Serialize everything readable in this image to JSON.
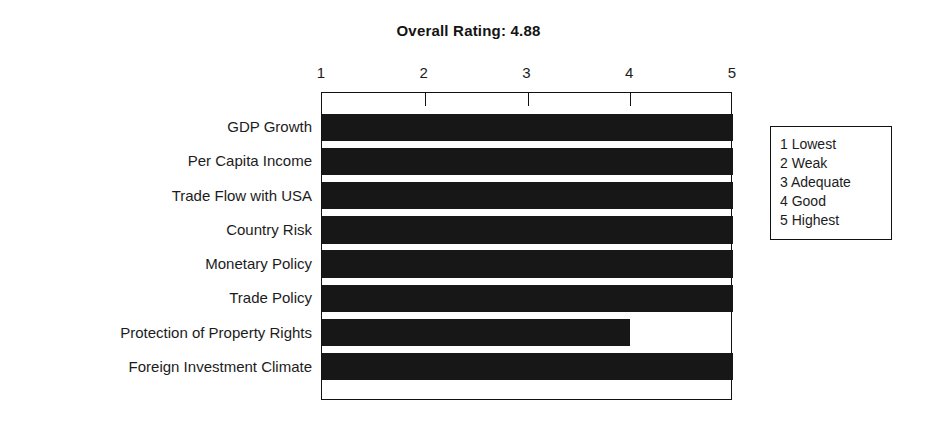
{
  "chart_data": {
    "type": "bar",
    "orientation": "horizontal",
    "title": "Overall Rating: 4.88",
    "xlabel": "",
    "ylabel": "",
    "xlim": [
      1,
      5
    ],
    "xticks": [
      1,
      2,
      3,
      4,
      5
    ],
    "xtick_labels": [
      "1",
      "2",
      "3",
      "4",
      "5"
    ],
    "grid": false,
    "categories": [
      "GDP Growth",
      "Per Capita Income",
      "Trade Flow with USA",
      "Country Risk",
      "Monetary Policy",
      "Trade Policy",
      "Protection of Property Rights",
      "Foreign Investment Climate"
    ],
    "values": [
      5,
      5,
      5,
      5,
      5,
      5,
      4,
      5
    ],
    "bar_color": "#171717",
    "plot_background": "#ffffff",
    "legend_position": "right-outside",
    "legend_title": "",
    "legend_entries": [
      "1 Lowest",
      "2 Weak",
      "3 Adequate",
      "4 Good",
      "5 Highest"
    ]
  },
  "overall_rating": "4.88"
}
